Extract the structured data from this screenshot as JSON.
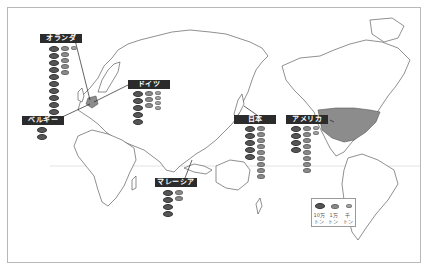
{
  "map": {
    "type": "world-map",
    "highlighted_regions": [
      "Netherlands",
      "United States"
    ],
    "highlight_color": "#8c8c8c",
    "equator_line_color": "#d8d8d8"
  },
  "countries": [
    {
      "label": "オランダ",
      "large": 10,
      "medium": 5,
      "small": 1
    },
    {
      "label": "ドイツ",
      "large": 5,
      "medium": 3,
      "small": 4
    },
    {
      "label": "ベルギー",
      "large": 2,
      "medium": 0,
      "small": 0
    },
    {
      "label": "日本",
      "large": 5,
      "medium": 9,
      "small": 0
    },
    {
      "label": "アメリカ",
      "large": 4,
      "medium": 8,
      "small": 2
    },
    {
      "label": "マレーシア",
      "large": 4,
      "medium": 2,
      "small": 0
    }
  ],
  "legend": {
    "large": "10万\nトン",
    "medium": "1万\nトン",
    "small": "千\nトン"
  }
}
